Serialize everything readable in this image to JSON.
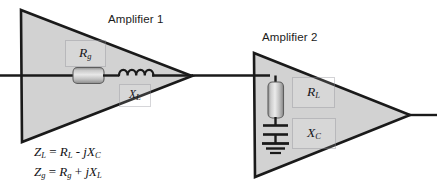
{
  "figure": {
    "title_amp1": "Amplifier 1",
    "title_amp2": "Amplifier 2",
    "background_color": "#ffffff",
    "amplifier_fill": "#d2d2d2",
    "outline_color": "#1a1a1a",
    "wire_color": "#1a1a1a"
  },
  "amplifier1": {
    "name": "Amplifier 1",
    "components": [
      {
        "id": "rg",
        "type": "resistor",
        "label": "R",
        "subscript": "g",
        "orientation": "horizontal"
      },
      {
        "id": "xl",
        "type": "inductor",
        "label": "X",
        "subscript": "L",
        "orientation": "horizontal"
      }
    ],
    "labels": {
      "rg_main": "R",
      "rg_sub": "g",
      "xl_main": "X",
      "xl_sub": "L"
    }
  },
  "amplifier2": {
    "name": "Amplifier 2",
    "components": [
      {
        "id": "rl",
        "type": "resistor",
        "label": "R",
        "subscript": "L",
        "orientation": "vertical"
      },
      {
        "id": "xc",
        "type": "capacitor",
        "label": "X",
        "subscript": "C",
        "orientation": "vertical"
      },
      {
        "id": "gnd",
        "type": "ground",
        "label": "",
        "subscript": "",
        "orientation": "vertical"
      }
    ],
    "labels": {
      "rl_main": "R",
      "rl_sub": "L",
      "xc_main": "X",
      "xc_sub": "C"
    }
  },
  "equations": {
    "line1": {
      "lhs_main": "Z",
      "lhs_sub": "L",
      "eq": " = ",
      "t1_main": "R",
      "t1_sub": "L",
      "op": " - ",
      "t2_j": " j",
      "t2_main": "X",
      "t2_sub": "C",
      "plain": "Z_L = R_L - jX_C"
    },
    "line2": {
      "lhs_main": "Z",
      "lhs_sub": "g",
      "eq": " = ",
      "t1_main": "R",
      "t1_sub": "g",
      "op": " + ",
      "t2_j": " j",
      "t2_main": "X",
      "t2_sub": "L",
      "plain": "Z_g = R_g + jX_L"
    }
  }
}
